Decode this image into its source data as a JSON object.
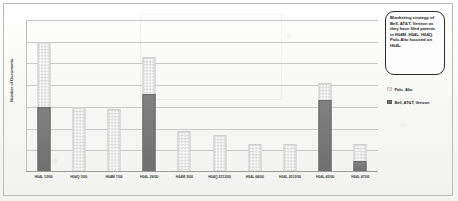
{
  "chart_data": {
    "type": "bar",
    "title": "",
    "xlabel": "",
    "ylabel": "Number of Documents",
    "grid": true,
    "grid_lines": 6,
    "ylim": [
      0,
      7
    ],
    "legend_position": "right",
    "overlap": "overlapping",
    "categories": [
      "H04L 12/00",
      "H04Q 3/00",
      "H04M 7/00",
      "H04L 29/00",
      "H04M 3/00",
      "H04Q 2213/00",
      "H04L 64/00",
      "H04L 2012/00",
      "H04L 45/00",
      "H04L 47/00"
    ],
    "series": [
      {
        "name": "Palo_Alto",
        "style": "dotted-light",
        "color": "#dcdcdc",
        "values": [
          6.0,
          3.0,
          2.9,
          5.3,
          1.9,
          1.7,
          1.3,
          1.3,
          4.1,
          1.3
        ]
      },
      {
        "name": "Bell, AT&T, Verizon",
        "style": "solid-dark",
        "color": "#6f6f6f",
        "values": [
          3.0,
          0,
          0,
          3.6,
          0,
          0,
          0,
          0,
          3.3,
          0.5
        ]
      }
    ]
  },
  "annotation": {
    "callout_text": "Blanketing strategy of Bell, AT&T, Verizon as they have filed patents in H04M, H04L, H04Q. Palo-Alto focused on H04L."
  },
  "legend": {
    "items": [
      {
        "label": "Palo_Alto",
        "swatch": "dotted-light"
      },
      {
        "label": "Bell, AT&T, Verizon",
        "swatch": "solid-dark"
      }
    ]
  }
}
